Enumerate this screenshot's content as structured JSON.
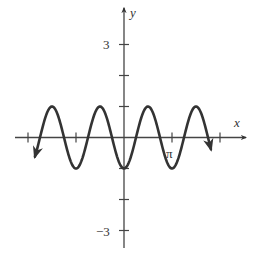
{
  "chart_data": {
    "type": "line",
    "title": "",
    "function": "y = -cos(2x)",
    "xlabel": "x",
    "ylabel": "y",
    "x_ticks": [
      {
        "value": -6.2832,
        "label": ""
      },
      {
        "value": -3.1416,
        "label": ""
      },
      {
        "value": 3.1416,
        "label": "π"
      },
      {
        "value": 6.2832,
        "label": ""
      }
    ],
    "y_ticks": [
      {
        "value": 3,
        "label": "3"
      },
      {
        "value": 2,
        "label": ""
      },
      {
        "value": 1,
        "label": ""
      },
      {
        "value": -1,
        "label": ""
      },
      {
        "value": -2,
        "label": ""
      },
      {
        "value": -3,
        "label": "−3"
      }
    ],
    "xlim": [
      -7.4,
      8.1
    ],
    "ylim": [
      -3.6,
      4.3
    ],
    "series": [
      {
        "name": "-cos(2x)",
        "x_range": [
          -5.83,
          5.69
        ],
        "amplitude": 1,
        "period": 3.1416,
        "key_points": [
          {
            "x": -4.712,
            "y": 1
          },
          {
            "x": -3.1416,
            "y": -1
          },
          {
            "x": -1.5708,
            "y": 1
          },
          {
            "x": 0,
            "y": -1
          },
          {
            "x": 1.5708,
            "y": 1
          },
          {
            "x": 3.1416,
            "y": -1
          },
          {
            "x": 4.712,
            "y": 1
          }
        ],
        "arrows_at_ends": true
      }
    ],
    "grid": false,
    "legend": null
  },
  "style": {
    "axis_color": "#444444",
    "curve_color": "#333333",
    "label_color": "#333333"
  },
  "labels": {
    "x_axis": "x",
    "y_axis": "y",
    "pi_tick": "π",
    "y_three": "3",
    "y_neg_three": "−3"
  }
}
